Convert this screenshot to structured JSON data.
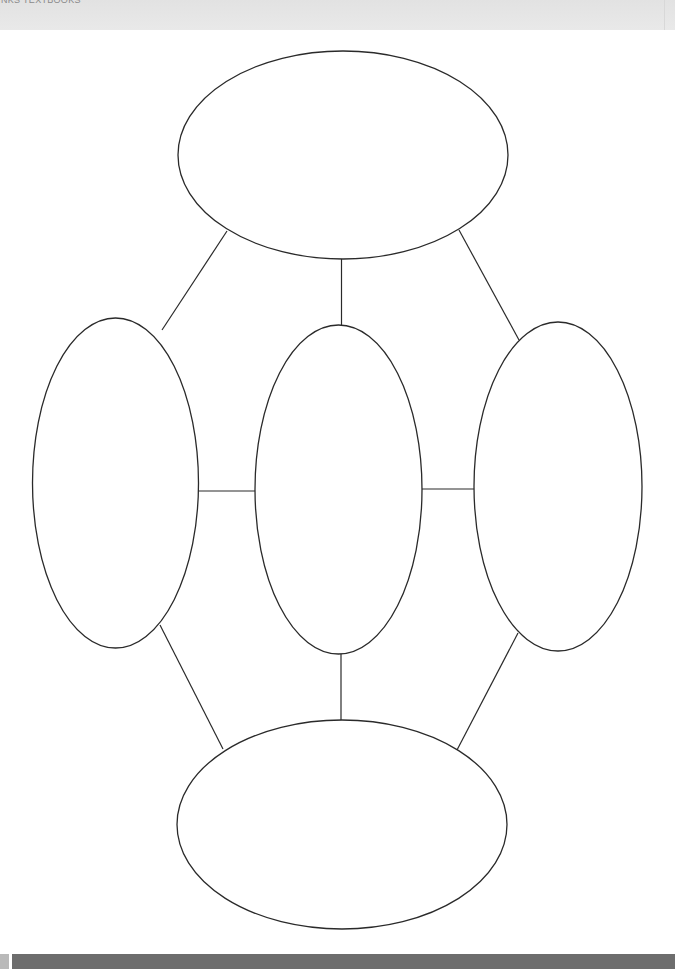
{
  "header": {
    "running_title": "NKS TEXTBOOKS"
  },
  "diagram": {
    "type": "blank graphic organizer (five-node web)",
    "stroke_color": "#2a2a2a",
    "fill_color": "#ffffff",
    "nodes": [
      {
        "id": "top",
        "label": "",
        "cx": 343,
        "cy": 155,
        "rx": 165,
        "ry": 104
      },
      {
        "id": "left",
        "label": "",
        "cx": 115.5,
        "cy": 483,
        "rx": 83,
        "ry": 165
      },
      {
        "id": "center",
        "label": "",
        "cx": 338.5,
        "cy": 489.5,
        "rx": 83.5,
        "ry": 164.5
      },
      {
        "id": "right",
        "label": "",
        "cx": 558,
        "cy": 486.5,
        "rx": 84,
        "ry": 164.5
      },
      {
        "id": "bottom",
        "label": "",
        "cx": 342,
        "cy": 824.5,
        "rx": 165,
        "ry": 104.5
      }
    ],
    "edges": [
      {
        "from": "top",
        "to": "left",
        "x1": 227,
        "y1": 231,
        "x2": 162,
        "y2": 330
      },
      {
        "from": "top",
        "to": "center",
        "x1": 341.5,
        "y1": 259,
        "x2": 341.5,
        "y2": 325
      },
      {
        "from": "top",
        "to": "right",
        "x1": 459,
        "y1": 230,
        "x2": 519,
        "y2": 340
      },
      {
        "from": "left",
        "to": "center",
        "x1": 199,
        "y1": 491,
        "x2": 255,
        "y2": 491
      },
      {
        "from": "center",
        "to": "right",
        "x1": 422,
        "y1": 489,
        "x2": 474,
        "y2": 489
      },
      {
        "from": "left",
        "to": "bottom",
        "x1": 160,
        "y1": 625,
        "x2": 223,
        "y2": 749
      },
      {
        "from": "center",
        "to": "bottom",
        "x1": 341,
        "y1": 654,
        "x2": 341,
        "y2": 720
      },
      {
        "from": "right",
        "to": "bottom",
        "x1": 518,
        "y1": 633,
        "x2": 457,
        "y2": 750
      }
    ]
  },
  "footer": {
    "tab_color": "#b9b9b9",
    "bar_color": "#6d6d6d"
  }
}
